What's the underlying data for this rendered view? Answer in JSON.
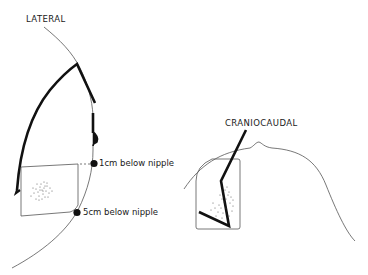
{
  "diagram": {
    "background_color": "#ffffff",
    "ink_color": "#1a1a1a",
    "lateral_view": {
      "title": "LATERAL",
      "markers": [
        {
          "label": "1cm below nipple"
        },
        {
          "label": "5cm below nipple"
        }
      ]
    },
    "craniocaudal_view": {
      "title": "CRANIOCAUDAL"
    }
  }
}
